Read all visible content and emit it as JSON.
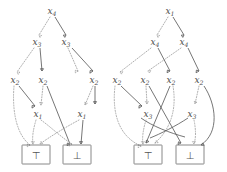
{
  "figure": {
    "kind": "binary-decision-diagram-pair",
    "edge_styles": {
      "low_edge": "dotted",
      "high_edge": "solid"
    },
    "colors": {
      "solid_edge": "#5d5d5d",
      "dotted_edge": "#9b9b9b",
      "node_text": "#4a4a4a",
      "terminal_stroke": "#6a6a6a",
      "background": "#ffffff"
    },
    "terminals": {
      "true_glyph": "⊤",
      "false_glyph": "⊥"
    },
    "left": {
      "name": "left-bdd",
      "nodes": [
        {
          "id": "L-r",
          "label": "x",
          "sub": "4",
          "x": 52,
          "y": 11
        },
        {
          "id": "L-a",
          "label": "x",
          "sub": "3",
          "x": 37,
          "y": 42
        },
        {
          "id": "L-b",
          "label": "x",
          "sub": "3",
          "x": 66,
          "y": 42
        },
        {
          "id": "L-c",
          "label": "x",
          "sub": "2",
          "x": 15,
          "y": 80
        },
        {
          "id": "L-d",
          "label": "x",
          "sub": "2",
          "x": 43,
          "y": 80
        },
        {
          "id": "L-e",
          "label": "x",
          "sub": "2",
          "x": 94,
          "y": 80
        },
        {
          "id": "L-f",
          "label": "x",
          "sub": "1",
          "x": 38,
          "y": 114
        },
        {
          "id": "L-g",
          "label": "x",
          "sub": "1",
          "x": 82,
          "y": 114
        }
      ],
      "terminals": [
        {
          "id": "L-T",
          "glyph": "⊤",
          "x": 36,
          "y": 155
        },
        {
          "id": "L-F",
          "glyph": "⊥",
          "x": 77,
          "y": 155
        }
      ]
    },
    "right": {
      "name": "right-bdd",
      "nodes": [
        {
          "id": "R-r",
          "label": "x",
          "sub": "1",
          "x": 170,
          "y": 11
        },
        {
          "id": "R-a",
          "label": "x",
          "sub": "4",
          "x": 155,
          "y": 42
        },
        {
          "id": "R-b",
          "label": "x",
          "sub": "4",
          "x": 184,
          "y": 42
        },
        {
          "id": "R-c",
          "label": "x",
          "sub": "2",
          "x": 117,
          "y": 80
        },
        {
          "id": "R-d",
          "label": "x",
          "sub": "2",
          "x": 145,
          "y": 80
        },
        {
          "id": "R-e",
          "label": "x",
          "sub": "2",
          "x": 171,
          "y": 80
        },
        {
          "id": "R-f",
          "label": "x",
          "sub": "2",
          "x": 199,
          "y": 80
        },
        {
          "id": "R-g",
          "label": "x",
          "sub": "3",
          "x": 148,
          "y": 114
        },
        {
          "id": "R-h",
          "label": "x",
          "sub": "3",
          "x": 192,
          "y": 114
        }
      ],
      "terminals": [
        {
          "id": "R-T",
          "glyph": "⊤",
          "x": 148,
          "y": 155
        },
        {
          "id": "R-F",
          "glyph": "⊥",
          "x": 190,
          "y": 155
        }
      ]
    }
  }
}
